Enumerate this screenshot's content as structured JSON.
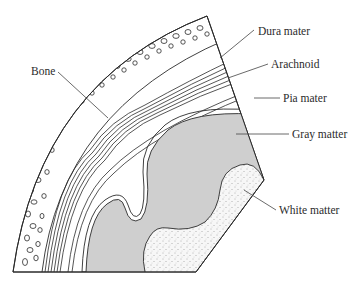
{
  "diagram": {
    "colors": {
      "line": "#2b2b2b",
      "gray_matter": "#cfcfcf",
      "white_matter": "#f4f4f4",
      "background": "#ffffff"
    },
    "labels": [
      {
        "id": "bone",
        "text": "Bone"
      },
      {
        "id": "dura",
        "text": "Dura mater"
      },
      {
        "id": "arachnoid",
        "text": "Arachnoid"
      },
      {
        "id": "pia",
        "text": "Pia mater"
      },
      {
        "id": "gray",
        "text": "Gray matter"
      },
      {
        "id": "white",
        "text": "White matter"
      }
    ]
  }
}
